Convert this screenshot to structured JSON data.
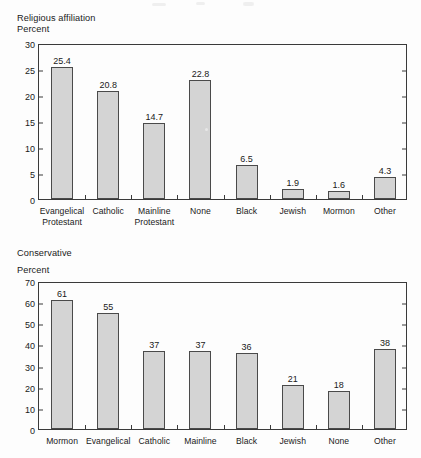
{
  "charts": [
    {
      "id": "religious-affiliation",
      "title": "Religious affiliation",
      "axis_label": "Percent",
      "chart_data": {
        "type": "bar",
        "title": "Religious affiliation",
        "xlabel": "",
        "ylabel": "Percent",
        "ylim": [
          0,
          30
        ],
        "yticks": [
          0,
          5,
          10,
          15,
          20,
          25,
          30
        ],
        "grid": false,
        "legend": "none",
        "categories": [
          "Evangelical Protestant",
          "Catholic",
          "Mainline Protestant",
          "None",
          "Black",
          "Jewish",
          "Mormon",
          "Other"
        ],
        "category_lines": [
          [
            "Evangelical",
            "Protestant"
          ],
          [
            "Catholic",
            ""
          ],
          [
            "Mainline",
            "Protestant"
          ],
          [
            "None",
            ""
          ],
          [
            "Black",
            ""
          ],
          [
            "Jewish",
            ""
          ],
          [
            "Mormon",
            ""
          ],
          [
            "Other",
            ""
          ]
        ],
        "values": [
          25.4,
          20.8,
          14.7,
          22.8,
          6.5,
          1.9,
          1.6,
          4.3
        ],
        "value_labels": [
          "25.4",
          "20.8",
          "14.7",
          "22.8",
          "6.5",
          "1.9",
          "1.6",
          "4.3"
        ]
      }
    },
    {
      "id": "conservative",
      "title": "Conservative",
      "axis_label": "Percent",
      "chart_data": {
        "type": "bar",
        "title": "Conservative",
        "xlabel": "",
        "ylabel": "Percent",
        "ylim": [
          0,
          70
        ],
        "yticks": [
          0,
          10,
          20,
          30,
          40,
          50,
          60,
          70
        ],
        "grid": false,
        "legend": "none",
        "categories": [
          "Mormon",
          "Evangelical",
          "Catholic",
          "Mainline",
          "Black",
          "Jewish",
          "None",
          "Other"
        ],
        "category_lines": [
          [
            "Mormon",
            ""
          ],
          [
            "Evangelical",
            ""
          ],
          [
            "Catholic",
            ""
          ],
          [
            "Mainline",
            ""
          ],
          [
            "Black",
            ""
          ],
          [
            "Jewish",
            ""
          ],
          [
            "None",
            ""
          ],
          [
            "Other",
            ""
          ]
        ],
        "values": [
          61,
          55,
          37,
          37,
          36,
          21,
          18,
          38
        ],
        "value_labels": [
          "61",
          "55",
          "37",
          "37",
          "36",
          "21",
          "18",
          "38"
        ]
      }
    }
  ],
  "colors": {
    "bar_fill": "#d4d4d4",
    "bar_stroke": "#4a4a4a",
    "axis": "#3a3a3a",
    "text": "#1a1a1a",
    "background": "#fdfdfd"
  }
}
